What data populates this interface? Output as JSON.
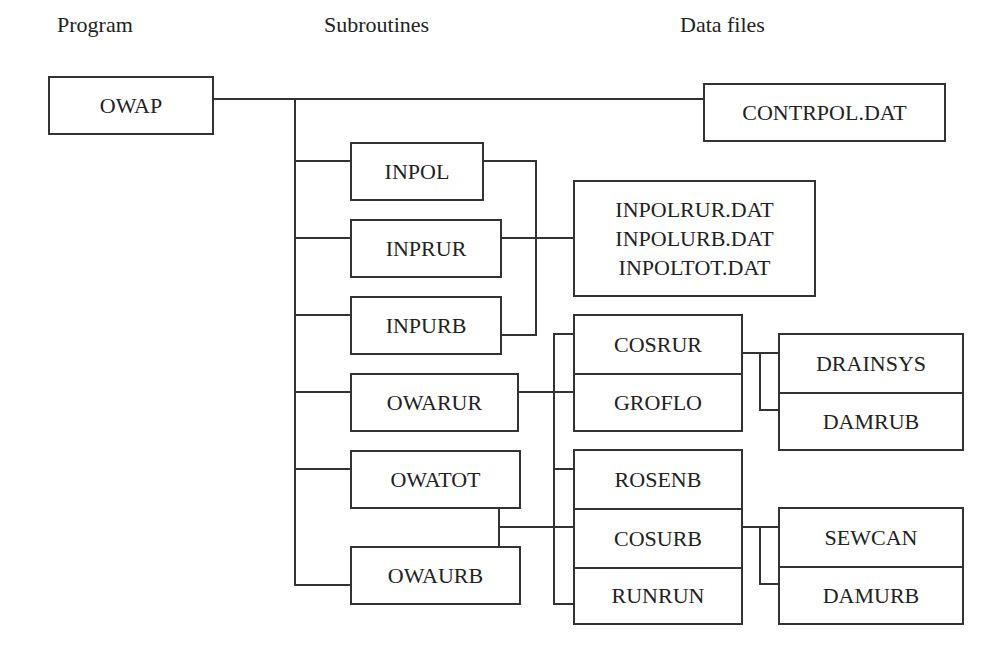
{
  "headers": {
    "program": "Program",
    "subroutines": "Subroutines",
    "data_files": "Data files"
  },
  "program": {
    "name": "OWAP"
  },
  "subroutines": [
    {
      "name": "INPOL"
    },
    {
      "name": "INPRUR"
    },
    {
      "name": "INPURB"
    },
    {
      "name": "OWARUR"
    },
    {
      "name": "OWATOT"
    },
    {
      "name": "OWAURB"
    }
  ],
  "sub_subroutines": {
    "rural": [
      "COSRUR",
      "GROFLO"
    ],
    "urban": [
      "ROSENB",
      "COSURB",
      "RUNRUN"
    ]
  },
  "modules": {
    "rural": [
      "DRAINSYS",
      "DAMRUB"
    ],
    "urban": [
      "SEWCAN",
      "DAMURB"
    ]
  },
  "data_files": {
    "control": "CONTRPOL.DAT",
    "input": [
      "INPOLRUR.DAT",
      "INPOLURB.DAT",
      "INPOLTOT.DAT"
    ]
  },
  "colors": {
    "line": "#333333",
    "background": "#ffffff",
    "text": "#222222"
  }
}
